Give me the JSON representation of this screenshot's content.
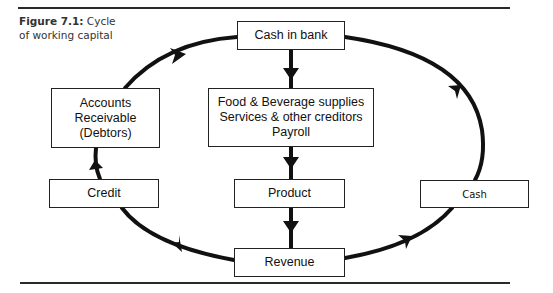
{
  "figure": {
    "label": "Figure 7.1:",
    "caption_rest": " Cycle",
    "caption_line2": "of working capital"
  },
  "nodes": {
    "cash_in_bank": "Cash in bank",
    "supplies": [
      "Food & Beverage supplies",
      "Services & other creditors",
      "Payroll"
    ],
    "product": "Product",
    "revenue": "Revenue",
    "accounts_receivable": [
      "Accounts",
      "Receivable",
      "(Debtors)"
    ],
    "credit": "Credit",
    "cash": "Cash"
  },
  "colors": {
    "line": "#111111",
    "rule": "#2a2a2a"
  }
}
